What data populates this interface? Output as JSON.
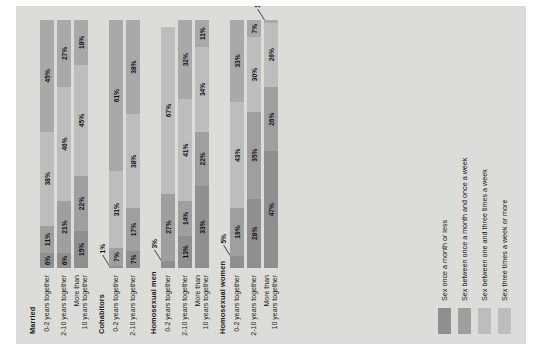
{
  "figure": {
    "caption": "FIGURE 3.1"
  },
  "chart_data": {
    "type": "bar",
    "orientation": "horizontal-stacked",
    "title": "",
    "subtitle": "",
    "xlabel": "",
    "ylabel": "",
    "xlim": [
      0,
      100
    ],
    "grid": false,
    "legend_position": "bottom-left",
    "rotation_note": "chart rendered rotated 90 degrees counter-clockwise in screenshot",
    "legend": [
      "Sex once a month or less",
      "Sex between once a month and once a week",
      "Sex between one and three times a week",
      "Sex three times a week or more"
    ],
    "series": [
      {
        "name": "Sex once a month or less"
      },
      {
        "name": "Sex between once a month and once a week"
      },
      {
        "name": "Sex between one and three times a week"
      },
      {
        "name": "Sex three times a week or more"
      }
    ],
    "groups": [
      {
        "name": "Married",
        "rows": [
          {
            "label_lines": [
              "0-2 years together"
            ],
            "values": [
              6,
              11,
              38,
              45
            ]
          },
          {
            "label_lines": [
              "2-10 years together"
            ],
            "values": [
              6,
              21,
              46,
              27
            ]
          },
          {
            "label_lines": [
              "More than",
              "10 years together"
            ],
            "values": [
              15,
              22,
              45,
              18
            ]
          }
        ]
      },
      {
        "name": "Cohabitors",
        "rows": [
          {
            "label_lines": [
              "0-2 years together"
            ],
            "values": [
              1,
              7,
              31,
              61
            ]
          },
          {
            "label_lines": [
              "2-10 years together"
            ],
            "values": [
              7,
              17,
              38,
              38
            ]
          }
        ]
      },
      {
        "name": "Homosexual men",
        "rows": [
          {
            "label_lines": [
              "0-2 years together"
            ],
            "values": [
              3,
              27,
              67
            ]
          },
          {
            "label_lines": [
              "2-10 years together"
            ],
            "values": [
              13,
              14,
              41,
              32
            ]
          },
          {
            "label_lines": [
              "More than",
              "10 years together"
            ],
            "values": [
              33,
              22,
              34,
              11
            ]
          }
        ]
      },
      {
        "name": "Homosexual women",
        "rows": [
          {
            "label_lines": [
              "0-2 years together"
            ],
            "values": [
              5,
              19,
              43,
              33
            ]
          },
          {
            "label_lines": [
              "2-10 years together"
            ],
            "values": [
              28,
              35,
              30,
              7
            ]
          },
          {
            "label_lines": [
              "More than",
              "10 years together"
            ],
            "values": [
              47,
              26,
              26,
              1
            ]
          }
        ]
      }
    ],
    "colors": {
      "background": "#dcdcd8",
      "series0": "#8f8f8f",
      "series1": "#9f9f9f",
      "series2": "#bdbdbd",
      "series3": "#a9a9a9"
    }
  }
}
